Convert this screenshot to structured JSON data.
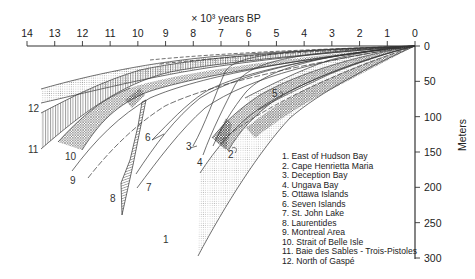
{
  "figure": {
    "x_axis_title": "× 10³ years BP",
    "y_axis_title": "Meters",
    "x_ticks": [
      "14",
      "13",
      "12",
      "11",
      "10",
      "9",
      "8",
      "7",
      "6",
      "5",
      "4",
      "3",
      "2",
      "1",
      "0"
    ],
    "y_ticks": [
      "0",
      "50",
      "100",
      "150",
      "200",
      "250",
      "300"
    ]
  },
  "legend": {
    "items": [
      "1. East of Hudson Bay",
      "2. Cape Henrietta Maria",
      "3. Deception Bay",
      "4. Ungava Bay",
      "5. Ottawa Islands",
      "6. Seven Islands",
      "7. St. John Lake",
      "8. Laurentides",
      "9. Montreal Area",
      "10. Strait of Belle Isle",
      "11. Baie des Sables - Trois-Pistoles",
      "12. North of Gaspé"
    ]
  },
  "curve_labels": [
    {
      "text": "1",
      "x": 163,
      "y": 243
    },
    {
      "text": "2",
      "x": 228,
      "y": 158
    },
    {
      "text": "3",
      "x": 186,
      "y": 150
    },
    {
      "text": "4",
      "x": 197,
      "y": 166
    },
    {
      "text": "5",
      "x": 272,
      "y": 97
    },
    {
      "text": "6",
      "x": 145,
      "y": 141
    },
    {
      "text": "7",
      "x": 146,
      "y": 191
    },
    {
      "text": "8",
      "x": 110,
      "y": 202
    },
    {
      "text": "9",
      "x": 70,
      "y": 184
    },
    {
      "text": "10",
      "x": 65,
      "y": 160
    },
    {
      "text": "11",
      "x": 28,
      "y": 153
    },
    {
      "text": "12",
      "x": 28,
      "y": 112
    }
  ],
  "chart_data": {
    "type": "line",
    "title": "",
    "xlabel": "× 10³ years BP",
    "ylabel": "Meters",
    "xlim": [
      14,
      0
    ],
    "ylim": [
      300,
      0
    ],
    "note": "Emergence (relative sea-level) envelope curves; each band converges to 0 m at 0 yr BP. Values approximate, read from pixel positions.",
    "series": [
      {
        "name": "1. East of Hudson Bay",
        "start_age_kyr": 6.6,
        "start_elev_m": [
          175,
          280
        ],
        "shape": "convex band, shaded"
      },
      {
        "name": "2. Cape Henrietta Maria",
        "start_age_kyr": 6.8,
        "start_elev_m": [
          125,
          150
        ],
        "shape": "band, cross-hatched"
      },
      {
        "name": "3. Deception Bay",
        "start_age_kyr": 7.4,
        "start_elev_m": [
          135,
          140
        ],
        "shape": "single curve"
      },
      {
        "name": "4. Ungava Bay",
        "start_age_kyr": 7.2,
        "start_elev_m": [
          145,
          160
        ],
        "shape": "band"
      },
      {
        "name": "5. Ottawa Islands",
        "start_age_kyr": 5.5,
        "start_elev_m": [
          85,
          100
        ],
        "shape": "band, cross-hatched"
      },
      {
        "name": "6. Seven Islands",
        "start_age_kyr": 9.5,
        "start_elev_m": [
          125,
          130
        ],
        "shape": "curve pair"
      },
      {
        "name": "7. St. John Lake",
        "start_age_kyr": 9.9,
        "start_elev_m": [
          205,
          215
        ],
        "shape": "curve pair"
      },
      {
        "name": "8. Laurentides",
        "start_age_kyr": 10.3,
        "start_elev_m": [
          215,
          235
        ],
        "shape": "steep hatched band"
      },
      {
        "name": "9. Montreal Area",
        "start_age_kyr": 11.8,
        "start_elev_m": [
          170,
          180
        ],
        "shape": "curve pair"
      },
      {
        "name": "10. Strait of Belle Isle",
        "start_age_kyr": 12.3,
        "start_elev_m": [
          140,
          150
        ],
        "shape": "band, cross-hatched"
      },
      {
        "name": "11. Baie des Sables - Trois-Pistoles",
        "start_age_kyr": 13.6,
        "start_elev_m": [
          95,
          150
        ],
        "shape": "wide hatched band"
      },
      {
        "name": "12. North of Gaspé",
        "start_age_kyr": 13.6,
        "start_elev_m": [
          60,
          70
        ],
        "shape": "band, dotted"
      }
    ]
  }
}
